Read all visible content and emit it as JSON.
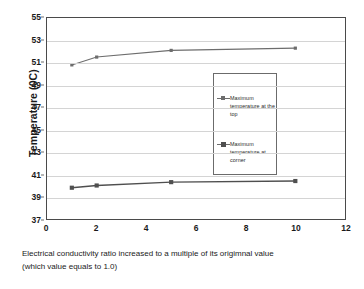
{
  "chart_data": {
    "type": "line",
    "title": "",
    "xlabel": "Electrical conductivity ratio increased to a multiple of its origimnal value (which value equals to 1.0)",
    "ylabel": "Temperature (0C)",
    "x": [
      1,
      2,
      5,
      10
    ],
    "series": [
      {
        "name": "Maximum temperature at the top",
        "values": [
          50.8,
          51.5,
          52.1,
          52.3
        ],
        "marker": "diamond",
        "color": "#6d6d6d"
      },
      {
        "name": "Maximum temperature at corner",
        "values": [
          39.8,
          40.0,
          40.3,
          40.4
        ],
        "marker": "square",
        "color": "#4f4f4f"
      }
    ],
    "xlim": [
      0,
      12
    ],
    "ylim": [
      37,
      55
    ],
    "xticks": [
      "0",
      "2",
      "4",
      "6",
      "8",
      "10",
      "12"
    ],
    "yticks": [
      "37",
      "39",
      "41",
      "43",
      "45",
      "47",
      "49",
      "51",
      "53",
      "55"
    ],
    "grid": "horizontal",
    "legend_position": "center-right-inside"
  },
  "axes": {
    "y_title": "Temperature (0C)",
    "x_caption_line1": "Electrical conductivity ratio increased to a multiple of its origimnal value",
    "x_caption_line2": "(which value equals to 1.0)"
  },
  "legend": {
    "items": [
      {
        "label": "Maximum temperature at the top"
      },
      {
        "label": "Maximum temperature at corner"
      }
    ]
  },
  "colors": {
    "top_series": "#6d6d6d",
    "corner_series": "#4f4f4f",
    "grid": "#d4d4d4",
    "frame": "#4a4a4a",
    "background": "#ffffff"
  }
}
